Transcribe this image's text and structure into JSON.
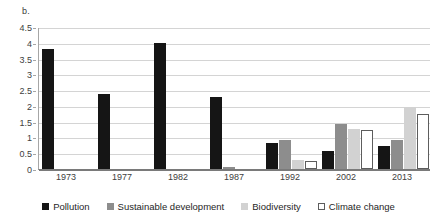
{
  "figure": {
    "panel_label": "b."
  },
  "chart_data": {
    "type": "bar",
    "title": "",
    "xlabel": "",
    "ylabel": "",
    "ylim": [
      0,
      4.5
    ],
    "ytick_step": 0.5,
    "yticks": [
      "0",
      "0.5",
      "1",
      "1.5",
      "2",
      "2.5",
      "3",
      "3.5",
      "4",
      "4.5"
    ],
    "ytick_values": [
      0,
      0.5,
      1,
      1.5,
      2,
      2.5,
      3,
      3.5,
      4,
      4.5
    ],
    "grid": "horizontal",
    "legend_position": "bottom",
    "categories": [
      "1973",
      "1977",
      "1982",
      "1987",
      "1992",
      "2002",
      "2013"
    ],
    "series": [
      {
        "name": "Pollution",
        "color": "#151515",
        "values": [
          3.8,
          2.38,
          4.0,
          2.27,
          0.84,
          0.57,
          0.72
        ]
      },
      {
        "name": "Sustainable development",
        "color": "#8d8d8d",
        "values": [
          0,
          0,
          0,
          0.05,
          0.93,
          1.42,
          0.93
        ]
      },
      {
        "name": "Biodiversity",
        "color": "#d2d2d2",
        "values": [
          0,
          0,
          0,
          0,
          0.28,
          1.28,
          1.95
        ]
      },
      {
        "name": "Climate change",
        "color": "#ffffff",
        "values": [
          0,
          0,
          0,
          0,
          0.25,
          1.23,
          1.75
        ]
      }
    ]
  }
}
